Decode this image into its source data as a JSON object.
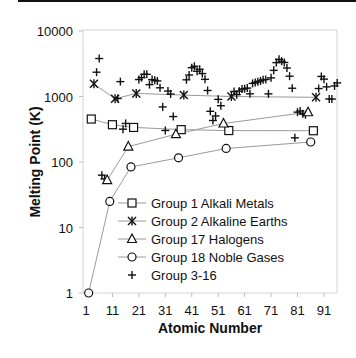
{
  "chart_data": {
    "type": "scatter",
    "title": "",
    "xlabel": "Atomic Number",
    "ylabel": "Melting Point (K)",
    "yscale": "log",
    "ylim": [
      1,
      10000
    ],
    "xlim": [
      1,
      97
    ],
    "x_ticks": [
      "1",
      "11",
      "21",
      "31",
      "41",
      "51",
      "61",
      "71",
      "81",
      "91"
    ],
    "y_ticks": [
      "1",
      "10",
      "100",
      "1000",
      "10000"
    ],
    "grid": false,
    "legend_position": "lower right inside",
    "series": [
      {
        "name": "Group 1 Alkali Metals",
        "marker": "square",
        "connected": true,
        "points": [
          [
            3,
            453
          ],
          [
            11,
            371
          ],
          [
            19,
            337
          ],
          [
            37,
            312
          ],
          [
            55,
            302
          ],
          [
            87,
            300
          ]
        ]
      },
      {
        "name": "Group 2 Alkaline Earths",
        "marker": "asterisk",
        "connected": true,
        "points": [
          [
            4,
            1560
          ],
          [
            12,
            923
          ],
          [
            20,
            1115
          ],
          [
            38,
            1050
          ],
          [
            56,
            1000
          ],
          [
            88,
            973
          ]
        ]
      },
      {
        "name": "Group 17 Halogens",
        "marker": "triangle",
        "connected": true,
        "points": [
          [
            9,
            53
          ],
          [
            17,
            172
          ],
          [
            35,
            266
          ],
          [
            53,
            387
          ],
          [
            85,
            575
          ]
        ]
      },
      {
        "name": "Group 18 Noble Gases",
        "marker": "circle",
        "connected": true,
        "points": [
          [
            2,
            1
          ],
          [
            10,
            25
          ],
          [
            18,
            84
          ],
          [
            36,
            116
          ],
          [
            54,
            161
          ],
          [
            86,
            202
          ]
        ]
      },
      {
        "name": "Group 3-16",
        "marker": "plus",
        "connected": false,
        "points": [
          [
            5,
            2350
          ],
          [
            6,
            3800
          ],
          [
            7,
            63
          ],
          [
            8,
            55
          ],
          [
            13,
            933
          ],
          [
            14,
            1687
          ],
          [
            15,
            317
          ],
          [
            16,
            388
          ],
          [
            21,
            1814
          ],
          [
            22,
            1941
          ],
          [
            23,
            2183
          ],
          [
            24,
            2180
          ],
          [
            25,
            1519
          ],
          [
            26,
            1811
          ],
          [
            27,
            1768
          ],
          [
            28,
            1728
          ],
          [
            29,
            1358
          ],
          [
            30,
            693
          ],
          [
            31,
            303
          ],
          [
            32,
            1211
          ],
          [
            33,
            1090
          ],
          [
            34,
            494
          ],
          [
            39,
            1799
          ],
          [
            40,
            2128
          ],
          [
            41,
            2750
          ],
          [
            42,
            2896
          ],
          [
            43,
            2430
          ],
          [
            44,
            2607
          ],
          [
            45,
            2237
          ],
          [
            46,
            1828
          ],
          [
            47,
            1235
          ],
          [
            48,
            594
          ],
          [
            49,
            430
          ],
          [
            50,
            505
          ],
          [
            51,
            904
          ],
          [
            52,
            723
          ],
          [
            57,
            1193
          ],
          [
            58,
            1068
          ],
          [
            59,
            1208
          ],
          [
            60,
            1297
          ],
          [
            61,
            1315
          ],
          [
            62,
            1345
          ],
          [
            63,
            1099
          ],
          [
            64,
            1585
          ],
          [
            65,
            1629
          ],
          [
            66,
            1680
          ],
          [
            67,
            1734
          ],
          [
            68,
            1802
          ],
          [
            69,
            1818
          ],
          [
            70,
            1097
          ],
          [
            71,
            1925
          ],
          [
            72,
            2506
          ],
          [
            73,
            3290
          ],
          [
            74,
            3695
          ],
          [
            75,
            3459
          ],
          [
            76,
            3306
          ],
          [
            77,
            2719
          ],
          [
            78,
            2041
          ],
          [
            79,
            1337
          ],
          [
            80,
            234
          ],
          [
            81,
            577
          ],
          [
            82,
            601
          ],
          [
            83,
            544
          ],
          [
            84,
            527
          ],
          [
            89,
            1323
          ],
          [
            90,
            2023
          ],
          [
            91,
            1841
          ],
          [
            92,
            1405
          ],
          [
            93,
            917
          ],
          [
            94,
            913
          ],
          [
            95,
            1449
          ],
          [
            96,
            1613
          ]
        ]
      }
    ]
  },
  "axes": {
    "xlabel": "Atomic Number",
    "ylabel": "Melting Point (K)"
  },
  "legend": {
    "items": [
      {
        "label": "Group 1 Alkali Metals",
        "marker": "square"
      },
      {
        "label": "Group 2 Alkaline Earths",
        "marker": "asterisk"
      },
      {
        "label": "Group 17 Halogens",
        "marker": "triangle"
      },
      {
        "label": "Group 18 Noble Gases",
        "marker": "circle"
      },
      {
        "label": "Group 3-16",
        "marker": "plus"
      }
    ]
  },
  "colors": {
    "line": "#9a9a9a",
    "marker": "#111111",
    "frame": "#cfcfcf"
  }
}
